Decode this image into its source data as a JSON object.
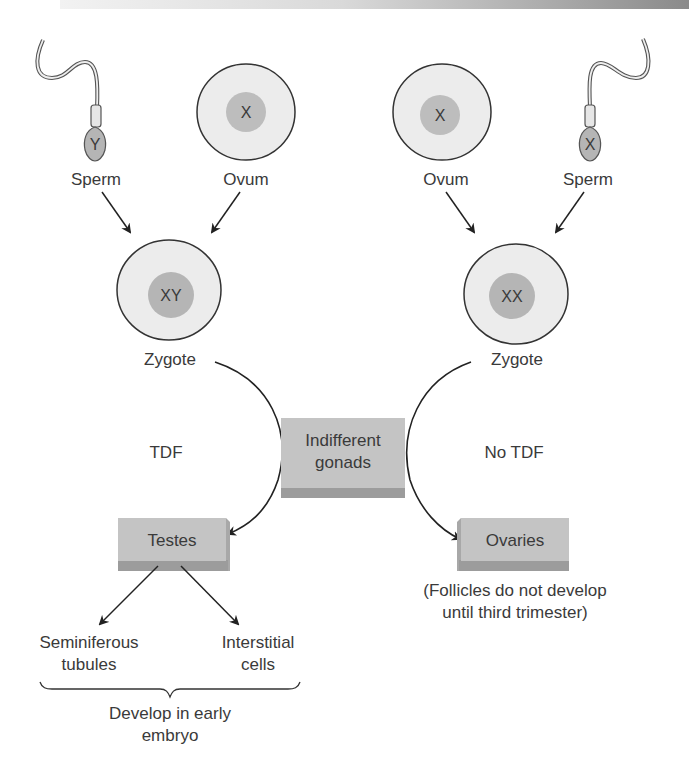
{
  "diagram": {
    "left_branch": {
      "sperm": {
        "label": "Sperm",
        "chromosome": "Y"
      },
      "ovum": {
        "label": "Ovum",
        "chromosome": "X"
      },
      "zygote": {
        "label": "Zygote",
        "chromosomes": "XY"
      },
      "factor_label": "TDF",
      "gonad": {
        "label": "Testes"
      },
      "derivatives": [
        {
          "line1": "Seminiferous",
          "line2": "tubules"
        },
        {
          "line1": "Interstitial",
          "line2": "cells"
        }
      ],
      "brace_note": {
        "line1": "Develop in early",
        "line2": "embryo"
      }
    },
    "right_branch": {
      "ovum": {
        "label": "Ovum",
        "chromosome": "X"
      },
      "sperm": {
        "label": "Sperm",
        "chromosome": "X"
      },
      "zygote": {
        "label": "Zygote",
        "chromosomes": "XX"
      },
      "factor_label": "No TDF",
      "gonad": {
        "label": "Ovaries"
      },
      "note": {
        "line1": "(Follicles do not develop",
        "line2": "until third trimester)"
      }
    },
    "center": {
      "line1": "Indifferent",
      "line2": "gonads"
    },
    "colors": {
      "cell_fill": "#ececec",
      "nucleus_fill": "#bdbdbd",
      "box_fill": "#c4c4c4",
      "box_shadow": "#9c9c9c",
      "stroke": "#333333",
      "text": "#3a3a3a"
    }
  }
}
